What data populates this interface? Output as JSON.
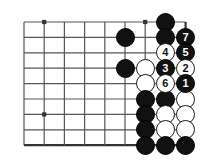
{
  "figure": {
    "kind": "go-board-diagram",
    "board_size_shown": {
      "columns": 9,
      "rows": 9
    },
    "colors": {
      "background": "#ffffff",
      "grid_line": "#555555",
      "edge_line": "#333333",
      "black_stone": "#111111",
      "white_stone": "#ffffff",
      "white_stone_border": "#1a1a1a",
      "black_number_text": "#ffffff",
      "white_number_text": "#111111"
    },
    "geometry": {
      "origin_x": 24,
      "origin_y": 22,
      "step_x": 20.2,
      "step_y": 15.4,
      "stone_diameter": 19
    }
  },
  "grid": {
    "vertical_lines": 9,
    "horizontal_lines": 9,
    "right_edge_is_board_border": true,
    "bottom_edge_is_board_border": true
  },
  "star_points": [
    {
      "col": 1,
      "row": 0
    },
    {
      "col": 1,
      "row": 6
    },
    {
      "col": 6,
      "row": 0
    }
  ],
  "stones": [
    {
      "col": 7,
      "row": 0,
      "color": "black",
      "label": ""
    },
    {
      "col": 5,
      "row": 1,
      "color": "black",
      "label": ""
    },
    {
      "col": 7,
      "row": 1,
      "color": "black",
      "label": ""
    },
    {
      "col": 8,
      "row": 1,
      "color": "black",
      "label": "7"
    },
    {
      "col": 7,
      "row": 2,
      "color": "white",
      "label": "4"
    },
    {
      "col": 8,
      "row": 2,
      "color": "black",
      "label": "5"
    },
    {
      "col": 5,
      "row": 3,
      "color": "black",
      "label": ""
    },
    {
      "col": 6,
      "row": 3,
      "color": "white",
      "label": ""
    },
    {
      "col": 7,
      "row": 3,
      "color": "black",
      "label": "3"
    },
    {
      "col": 8,
      "row": 3,
      "color": "white",
      "label": "2"
    },
    {
      "col": 6,
      "row": 4,
      "color": "white",
      "label": ""
    },
    {
      "col": 7,
      "row": 4,
      "color": "white",
      "label": "6"
    },
    {
      "col": 8,
      "row": 4,
      "color": "black",
      "label": "1"
    },
    {
      "col": 6,
      "row": 5,
      "color": "black",
      "label": ""
    },
    {
      "col": 7,
      "row": 5,
      "color": "black",
      "label": ""
    },
    {
      "col": 8,
      "row": 5,
      "color": "white",
      "label": ""
    },
    {
      "col": 6,
      "row": 6,
      "color": "black",
      "label": ""
    },
    {
      "col": 7,
      "row": 6,
      "color": "white",
      "label": ""
    },
    {
      "col": 8,
      "row": 6,
      "color": "white",
      "label": ""
    },
    {
      "col": 6,
      "row": 7,
      "color": "black",
      "label": ""
    },
    {
      "col": 7,
      "row": 7,
      "color": "white",
      "label": ""
    },
    {
      "col": 8,
      "row": 7,
      "color": "white",
      "label": ""
    },
    {
      "col": 6,
      "row": 8,
      "color": "black",
      "label": ""
    },
    {
      "col": 7,
      "row": 8,
      "color": "black",
      "label": ""
    },
    {
      "col": 8,
      "row": 8,
      "color": "black",
      "label": ""
    }
  ],
  "move_sequence": [
    {
      "number": "1",
      "color": "black"
    },
    {
      "number": "2",
      "color": "white"
    },
    {
      "number": "3",
      "color": "black"
    },
    {
      "number": "4",
      "color": "white"
    },
    {
      "number": "5",
      "color": "black"
    },
    {
      "number": "6",
      "color": "white"
    },
    {
      "number": "7",
      "color": "black"
    }
  ]
}
